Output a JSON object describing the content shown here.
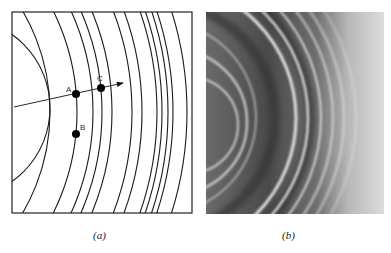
{
  "figure": {
    "panels": [
      {
        "id": "a",
        "caption": "(a)",
        "type": "line-drawing",
        "description": "Circular wavefronts with ray",
        "points": [
          {
            "label": "A",
            "x": 76,
            "y": 94
          },
          {
            "label": "B",
            "x": 76,
            "y": 134
          },
          {
            "label": "C",
            "x": 101,
            "y": 88
          }
        ],
        "arrow": {
          "from": [
            14,
            107
          ],
          "to": [
            123,
            83
          ]
        }
      },
      {
        "id": "b",
        "caption": "(b)",
        "type": "photograph",
        "description": "Photograph of circular ripples"
      }
    ]
  }
}
